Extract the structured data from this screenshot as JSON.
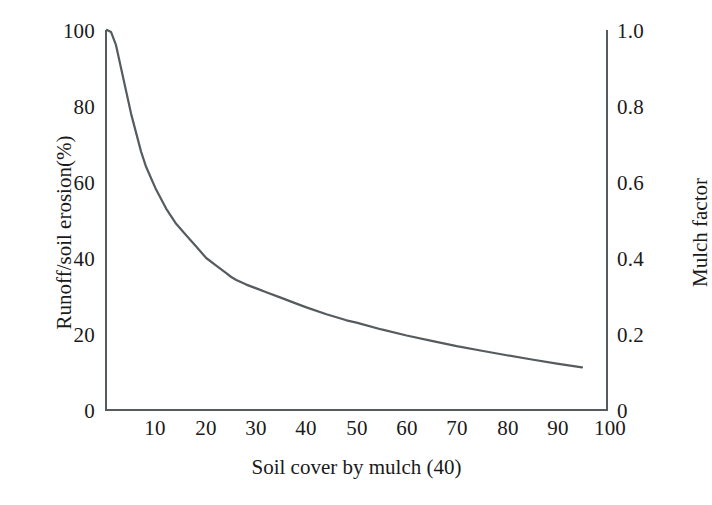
{
  "chart_data": {
    "type": "line",
    "title": "",
    "subtitle": "",
    "xlabel": "Soil cover by mulch (40)",
    "ylabel": "Runoff/soil erosion(%)",
    "y2label": "Mulch factor",
    "xlim": [
      0,
      100
    ],
    "ylim": [
      0,
      100
    ],
    "y2lim": [
      0,
      1.0
    ],
    "grid": false,
    "legend": null,
    "legend_position": "none",
    "xticks": [
      10,
      20,
      30,
      40,
      50,
      60,
      70,
      80,
      90,
      100
    ],
    "xticklabels": [
      "10",
      "20",
      "30",
      "40",
      "50",
      "60",
      "70",
      "80",
      "90",
      "100"
    ],
    "yticks": [
      0,
      20,
      40,
      60,
      80,
      100
    ],
    "yticklabels": [
      "0",
      "20",
      "40",
      "60",
      "80",
      "100"
    ],
    "y2ticks": [
      0,
      0.2,
      0.4,
      0.6,
      0.8,
      1.0
    ],
    "y2ticklabels": [
      "0",
      "0.2",
      "0.4",
      "0.6",
      "0.8",
      "1.0"
    ],
    "series": [
      {
        "name": "Runoff/soil erosion vs soil cover by mulch",
        "color": "#555b5e",
        "linewidth": 2.2,
        "x": [
          0.2,
          1,
          2,
          3,
          4,
          5,
          6,
          7,
          8,
          9,
          10,
          12,
          14,
          16,
          18,
          20,
          22,
          24,
          25,
          26,
          28,
          30,
          32,
          35,
          38,
          40,
          44,
          48,
          50,
          55,
          60,
          65,
          70,
          75,
          80,
          85,
          90,
          95
        ],
        "y": [
          100,
          99.5,
          96,
          90,
          84,
          78,
          73,
          68,
          64,
          61,
          58,
          53,
          49,
          46,
          43,
          40,
          38,
          36,
          35,
          34.2,
          33,
          32,
          31,
          29.5,
          28,
          27,
          25.2,
          23.6,
          23,
          21.2,
          19.6,
          18.2,
          16.8,
          15.6,
          14.4,
          13.3,
          12.2,
          11.2
        ]
      }
    ],
    "annotations": []
  },
  "axes": {
    "left_title": "Runoff/soil erosion(%)",
    "right_title": "Mulch factor",
    "bottom_title": "Soil cover by mulch (40)"
  },
  "colors": {
    "curve": "#555b5e",
    "axis": "#555b5e",
    "text": "#1a1a1a",
    "background": "#ffffff"
  }
}
